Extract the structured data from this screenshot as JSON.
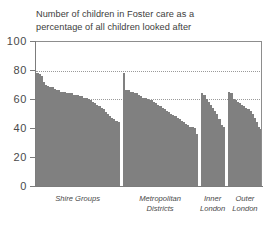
{
  "chart_data": {
    "type": "bar",
    "title": "Number of children in Foster care as a percentage of all children looked after",
    "title_lines": [
      "Number of children in Foster care as a",
      "percentage of all children looked after"
    ],
    "xlabel": "",
    "ylabel": "",
    "ylim": [
      0,
      100
    ],
    "yticks": [
      0,
      20,
      40,
      60,
      80,
      100
    ],
    "ytick_labels": [
      "0",
      "20",
      "40",
      "60",
      "80",
      "100"
    ],
    "grid": false,
    "legend": "none",
    "bar_color": "#808080",
    "reference_lines": [
      {
        "value": 80,
        "style": "dotted",
        "color": "#9a9a9a"
      },
      {
        "value": 61,
        "style": "dotted",
        "color": "#9a9a9a"
      }
    ],
    "categories": [
      "Shire Groups",
      "Metropolitan Districts",
      "Inner London",
      "Outer London"
    ],
    "group_label_lines": [
      [
        "Shire Groups"
      ],
      [
        "Metropolitan",
        "Districts"
      ],
      [
        "Inner",
        "London"
      ],
      [
        "Outer",
        "London"
      ]
    ],
    "groups": [
      {
        "name": "Shire Groups",
        "values": [
          78,
          77,
          76,
          72,
          70,
          69,
          68,
          68,
          67,
          66,
          66,
          65,
          65,
          65,
          64,
          64,
          64,
          63,
          63,
          63,
          62,
          62,
          61,
          61,
          60,
          59,
          58,
          57,
          56,
          55,
          54,
          53,
          51,
          50,
          48,
          47,
          46,
          45,
          44
        ]
      },
      {
        "name": "Metropolitan Districts",
        "values": [
          78,
          66,
          66,
          65,
          65,
          64,
          64,
          63,
          62,
          61,
          61,
          60,
          59,
          59,
          58,
          57,
          56,
          55,
          54,
          53,
          52,
          51,
          50,
          49,
          48,
          47,
          46,
          45,
          44,
          43,
          42,
          41,
          41,
          40,
          36
        ]
      },
      {
        "name": "Inner London",
        "values": [
          64,
          63,
          60,
          58,
          56,
          54,
          52,
          50,
          46,
          42,
          41
        ]
      },
      {
        "name": "Outer London",
        "values": [
          65,
          64,
          60,
          59,
          58,
          57,
          56,
          55,
          54,
          53,
          52,
          50,
          47,
          44,
          41,
          39
        ]
      }
    ]
  }
}
